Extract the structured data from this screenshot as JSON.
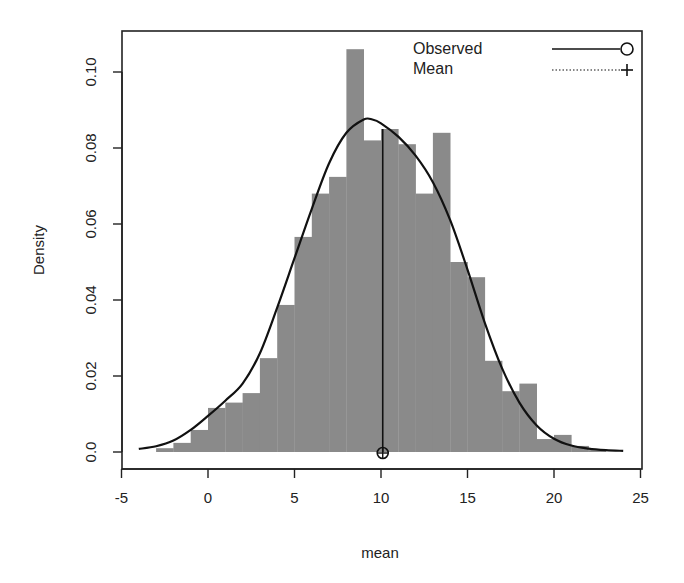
{
  "chart_data": {
    "type": "bar",
    "subtype": "histogram-with-density",
    "title": "",
    "xlabel": "mean",
    "ylabel": "Density",
    "xlim": [
      -5,
      25
    ],
    "ylim": [
      0,
      0.11
    ],
    "xticks": [
      -5,
      0,
      5,
      10,
      15,
      20,
      25
    ],
    "xtick_labels": [
      "-5",
      "0",
      "5",
      "10",
      "15",
      "20",
      "25"
    ],
    "yticks": [
      0.0,
      0.02,
      0.04,
      0.06,
      0.08,
      0.1
    ],
    "ytick_labels": [
      "0.0",
      "0.02",
      "0.04",
      "0.06",
      "0.08",
      "0.10"
    ],
    "grid": false,
    "legend_position": "top-right",
    "legend": [
      {
        "label": "Observed",
        "style": "solid line with open circle"
      },
      {
        "label": "Mean",
        "style": "dotted line with plus"
      }
    ],
    "histogram": {
      "bin_edges": [
        -3,
        -2,
        -1,
        0,
        1,
        2,
        3,
        4,
        5,
        6,
        7,
        8,
        9,
        10,
        11,
        12,
        13,
        14,
        15,
        16,
        17,
        18,
        19,
        20,
        21,
        22,
        23
      ],
      "densities": [
        0.001,
        0.0024,
        0.0058,
        0.0116,
        0.013,
        0.0155,
        0.0247,
        0.0387,
        0.0566,
        0.068,
        0.0724,
        0.106,
        0.082,
        0.085,
        0.081,
        0.068,
        0.084,
        0.05,
        0.046,
        0.024,
        0.016,
        0.018,
        0.0034,
        0.0045,
        0.0016,
        0.0005
      ],
      "color": "#8a8a8a"
    },
    "density_curve": {
      "x": [
        -4,
        -3,
        -2,
        -1,
        0,
        1,
        2,
        3,
        4,
        5,
        6,
        7,
        8,
        9,
        9.5,
        10,
        11,
        12,
        13,
        14,
        15,
        16,
        17,
        18,
        19,
        20,
        21,
        22,
        23,
        24
      ],
      "y": [
        0.0008,
        0.0015,
        0.003,
        0.0058,
        0.0095,
        0.0135,
        0.018,
        0.026,
        0.038,
        0.051,
        0.064,
        0.076,
        0.084,
        0.0875,
        0.0875,
        0.0865,
        0.083,
        0.078,
        0.071,
        0.061,
        0.048,
        0.034,
        0.022,
        0.013,
        0.007,
        0.0035,
        0.0017,
        0.0009,
        0.0005,
        0.0003
      ],
      "color": "#111111"
    },
    "mean_marker": {
      "x": 10.1,
      "y_top": 0.085,
      "symbol": "circle-plus"
    }
  }
}
